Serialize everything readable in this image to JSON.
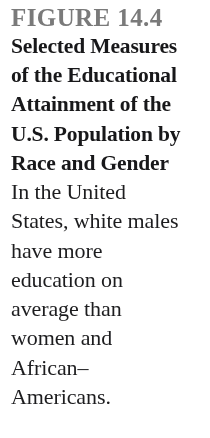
{
  "page": {
    "kind": "textbook-figure-caption",
    "background_color": "#ffffff",
    "width": 210,
    "height": 438
  },
  "figure": {
    "label": "FIGURE 14.4",
    "label_color": "#6f6f6f",
    "title_color": "#18181a",
    "body_color": "#1d1d1f",
    "title_text": "Selected Measures of the Educational Attainment of the U.S. Population by Race and Gender",
    "title_lines": [
      "Selected Measures",
      "of the Educational",
      "Attainment of the",
      "U.S. Population by",
      "Race and Gender"
    ],
    "body_text": "In the United States, white males have more education on average than women and African–Americans.",
    "body_lines": [
      "In the United",
      "States, white males",
      "have more",
      "education on",
      "average than",
      "women and",
      "African–",
      "Americans."
    ]
  }
}
